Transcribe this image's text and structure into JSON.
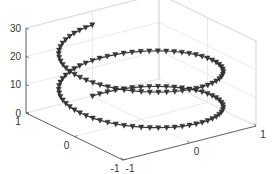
{
  "chart_data": {
    "type": "scatter",
    "subtype": "3d-line-with-markers",
    "title": "",
    "xlabel": "",
    "ylabel": "",
    "zlabel": "",
    "marker": "down-triangle",
    "series": [
      {
        "name": "helix",
        "parametric": {
          "t_range": [
            0,
            12.566
          ],
          "t_step": 0.1047,
          "x": "sin(t)",
          "y": "cos(t)",
          "z": "2*t"
        },
        "start_point": {
          "x": 0,
          "y": 1,
          "z": 0
        },
        "end_point": {
          "x": 0,
          "y": 1,
          "z": 25.1
        }
      }
    ],
    "xlim": [
      -1,
      1
    ],
    "ylim": [
      -1,
      1
    ],
    "zlim": [
      0,
      30
    ],
    "x_ticks": [
      "-1",
      "0",
      "1"
    ],
    "y_ticks": [
      "1",
      "0",
      "-1"
    ],
    "z_ticks": [
      "0",
      "10",
      "20",
      "30"
    ],
    "grid": true,
    "legend": null,
    "view": {
      "azimuth": -37.5,
      "elevation": 30
    }
  },
  "colors": {
    "line": "#3a3a3a",
    "marker": "#3a3a3a",
    "axis": "#555555",
    "grid": "#e4e4e4",
    "background": "#ffffff"
  }
}
